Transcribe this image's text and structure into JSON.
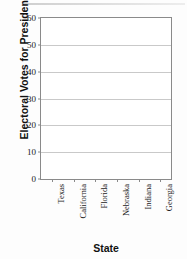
{
  "chart_data": {
    "type": "bar",
    "title": "",
    "subtitle": "",
    "xlabel": "State",
    "ylabel": "Electoral Votes for President",
    "categories": [
      "Texas",
      "California",
      "Florida",
      "Nebraska",
      "Indiana",
      "Georgia"
    ],
    "values": [
      null,
      null,
      null,
      null,
      null,
      null
    ],
    "series": [
      {
        "name": "Electoral Votes for President",
        "values": [
          null,
          null,
          null,
          null,
          null,
          null
        ]
      }
    ],
    "ylim": [
      0,
      60
    ],
    "yticks": [
      0,
      10,
      20,
      30,
      40,
      50,
      60
    ],
    "ytick_labels": [
      "0",
      "10",
      "20",
      "30",
      "40",
      "50",
      "60"
    ],
    "grid": "horizontal",
    "legend": "none",
    "annotations": [],
    "note": "Blank plotting grid: axes labeled, no bars drawn"
  },
  "figure": {
    "plot_background": "#ffffff",
    "frame_color": "#8a8a8a",
    "gridline_color": "#c9c9c9",
    "text_color": "#111111"
  }
}
